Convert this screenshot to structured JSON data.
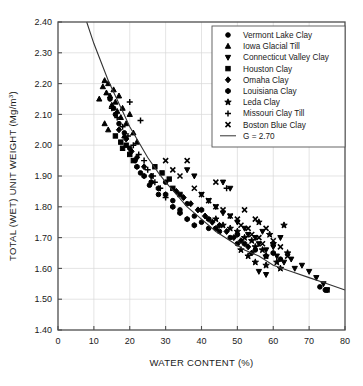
{
  "chart_data": {
    "type": "scatter",
    "title": "",
    "xlabel": "WATER CONTENT (%)",
    "ylabel": "TOTAL (WET) UNIT WEIGHT (Mg/m³)",
    "ylabel_main": "TOTAL (WET) UNIT WEIGHT (Mg/m",
    "ylabel_sup": "3",
    "ylabel_tail": ")",
    "xlim": [
      0,
      80
    ],
    "ylim": [
      1.4,
      2.4
    ],
    "xticks": [
      0,
      10,
      20,
      30,
      40,
      50,
      60,
      70,
      80
    ],
    "yticks": [
      "1.40",
      "1.50",
      "1.60",
      "1.70",
      "1.80",
      "1.90",
      "2.00",
      "2.10",
      "2.20",
      "2.30",
      "2.40"
    ],
    "xtick_labels": [
      "0",
      "10",
      "20",
      "30",
      "40",
      "50",
      "60",
      "70",
      "80"
    ],
    "grid": true,
    "grid_color": "#d9d9d9",
    "axis_color": "#4d4d4d",
    "marker_color": "#000000",
    "legend_position": "top-right",
    "legend": [
      {
        "label": "Vermont Lake Clay",
        "marker": "circle"
      },
      {
        "label": "Iowa Glacial Till",
        "marker": "triangle-up"
      },
      {
        "label": "Connecticut Valley Clay",
        "marker": "triangle-down"
      },
      {
        "label": "Houston Clay",
        "marker": "square"
      },
      {
        "label": "Omaha Clay",
        "marker": "diamond"
      },
      {
        "label": "Louisiana Clay",
        "marker": "hexagon"
      },
      {
        "label": "Leda Clay",
        "marker": "star"
      },
      {
        "label": "Missouri Clay Till",
        "marker": "plus"
      },
      {
        "label": "Boston Blue Clay",
        "marker": "x"
      },
      {
        "label": "G = 2.70",
        "marker": "line"
      }
    ],
    "curve": {
      "name": "G = 2.70",
      "label": "G = 2.70",
      "specific_gravity": 2.7,
      "description": "Zero air voids (100% saturation) line for specific gravity 2.70",
      "points": [
        {
          "x": 8.0,
          "y": 2.4
        },
        {
          "x": 10.0,
          "y": 2.33
        },
        {
          "x": 12.0,
          "y": 2.27
        },
        {
          "x": 14.0,
          "y": 2.21
        },
        {
          "x": 16.0,
          "y": 2.16
        },
        {
          "x": 18.0,
          "y": 2.11
        },
        {
          "x": 20.0,
          "y": 2.06
        },
        {
          "x": 22.0,
          "y": 2.02
        },
        {
          "x": 25.0,
          "y": 1.96
        },
        {
          "x": 28.0,
          "y": 1.91
        },
        {
          "x": 30.0,
          "y": 1.88
        },
        {
          "x": 33.0,
          "y": 1.84
        },
        {
          "x": 36.0,
          "y": 1.8
        },
        {
          "x": 40.0,
          "y": 1.76
        },
        {
          "x": 44.0,
          "y": 1.72
        },
        {
          "x": 48.0,
          "y": 1.69
        },
        {
          "x": 52.0,
          "y": 1.66
        },
        {
          "x": 56.0,
          "y": 1.64
        },
        {
          "x": 60.0,
          "y": 1.61
        },
        {
          "x": 65.0,
          "y": 1.59
        },
        {
          "x": 70.0,
          "y": 1.57
        },
        {
          "x": 75.0,
          "y": 1.55
        },
        {
          "x": 80.0,
          "y": 1.53
        }
      ]
    },
    "series": [
      {
        "name": "Vermont Lake Clay",
        "marker": "circle",
        "points": [
          {
            "x": 14.5,
            "y": 2.15
          },
          {
            "x": 15.5,
            "y": 2.12
          },
          {
            "x": 16.0,
            "y": 2.1
          },
          {
            "x": 17.0,
            "y": 2.07
          },
          {
            "x": 18.5,
            "y": 2.04
          },
          {
            "x": 20.0,
            "y": 1.99
          },
          {
            "x": 21.5,
            "y": 1.95
          },
          {
            "x": 23.0,
            "y": 1.91
          },
          {
            "x": 25.5,
            "y": 1.87
          },
          {
            "x": 28.0,
            "y": 1.84
          },
          {
            "x": 30.0,
            "y": 1.88
          },
          {
            "x": 32.0,
            "y": 1.82
          },
          {
            "x": 34.0,
            "y": 1.79
          },
          {
            "x": 36.0,
            "y": 1.81
          },
          {
            "x": 38.0,
            "y": 1.77
          },
          {
            "x": 40.0,
            "y": 1.75
          },
          {
            "x": 42.0,
            "y": 1.73
          },
          {
            "x": 45.0,
            "y": 1.72
          },
          {
            "x": 48.0,
            "y": 1.7
          },
          {
            "x": 50.0,
            "y": 1.68
          },
          {
            "x": 55.0,
            "y": 1.66
          },
          {
            "x": 58.0,
            "y": 1.64
          },
          {
            "x": 62.0,
            "y": 1.63
          },
          {
            "x": 73.0,
            "y": 1.54
          },
          {
            "x": 74.5,
            "y": 1.53
          }
        ]
      },
      {
        "name": "Iowa Glacial Till",
        "marker": "triangle-up",
        "points": [
          {
            "x": 11.5,
            "y": 2.15
          },
          {
            "x": 12.5,
            "y": 2.19
          },
          {
            "x": 13.0,
            "y": 2.21
          },
          {
            "x": 13.5,
            "y": 2.17
          },
          {
            "x": 14.0,
            "y": 2.2
          },
          {
            "x": 14.5,
            "y": 2.16
          },
          {
            "x": 15.0,
            "y": 2.13
          },
          {
            "x": 15.5,
            "y": 2.18
          },
          {
            "x": 16.0,
            "y": 2.14
          },
          {
            "x": 16.5,
            "y": 2.11
          },
          {
            "x": 17.0,
            "y": 2.16
          },
          {
            "x": 17.5,
            "y": 2.09
          },
          {
            "x": 18.0,
            "y": 2.12
          },
          {
            "x": 19.0,
            "y": 2.07
          },
          {
            "x": 20.0,
            "y": 2.1
          },
          {
            "x": 13.0,
            "y": 2.07
          },
          {
            "x": 14.0,
            "y": 2.05
          },
          {
            "x": 18.5,
            "y": 2.03
          },
          {
            "x": 21.0,
            "y": 2.04
          },
          {
            "x": 22.0,
            "y": 2.01
          }
        ]
      },
      {
        "name": "Connecticut Valley Clay",
        "marker": "triangle-down",
        "points": [
          {
            "x": 36.0,
            "y": 1.92
          },
          {
            "x": 38.0,
            "y": 1.9
          },
          {
            "x": 40.0,
            "y": 1.84
          },
          {
            "x": 42.0,
            "y": 1.82
          },
          {
            "x": 44.0,
            "y": 1.8
          },
          {
            "x": 46.0,
            "y": 1.78
          },
          {
            "x": 48.0,
            "y": 1.77
          },
          {
            "x": 50.0,
            "y": 1.75
          },
          {
            "x": 52.0,
            "y": 1.73
          },
          {
            "x": 53.0,
            "y": 1.71
          },
          {
            "x": 55.0,
            "y": 1.7
          },
          {
            "x": 56.0,
            "y": 1.68
          },
          {
            "x": 57.0,
            "y": 1.72
          },
          {
            "x": 58.0,
            "y": 1.66
          },
          {
            "x": 60.0,
            "y": 1.67
          },
          {
            "x": 61.0,
            "y": 1.64
          },
          {
            "x": 62.0,
            "y": 1.7
          },
          {
            "x": 63.0,
            "y": 1.62
          },
          {
            "x": 65.0,
            "y": 1.63
          },
          {
            "x": 66.0,
            "y": 1.6
          },
          {
            "x": 68.0,
            "y": 1.61
          },
          {
            "x": 70.0,
            "y": 1.59
          },
          {
            "x": 72.0,
            "y": 1.57
          },
          {
            "x": 74.0,
            "y": 1.55
          },
          {
            "x": 75.0,
            "y": 1.53
          },
          {
            "x": 56.0,
            "y": 1.59
          },
          {
            "x": 58.0,
            "y": 1.58
          },
          {
            "x": 46.0,
            "y": 1.88
          },
          {
            "x": 48.0,
            "y": 1.86
          }
        ]
      },
      {
        "name": "Houston Clay",
        "marker": "square",
        "points": [
          {
            "x": 16.0,
            "y": 2.03
          },
          {
            "x": 17.5,
            "y": 2.01
          },
          {
            "x": 18.0,
            "y": 1.99
          },
          {
            "x": 19.0,
            "y": 2.0
          },
          {
            "x": 20.0,
            "y": 1.97
          },
          {
            "x": 21.0,
            "y": 1.95
          },
          {
            "x": 27.0,
            "y": 1.93
          },
          {
            "x": 29.0,
            "y": 1.91
          },
          {
            "x": 31.0,
            "y": 1.89
          },
          {
            "x": 32.0,
            "y": 1.86
          },
          {
            "x": 34.0,
            "y": 1.84
          },
          {
            "x": 75.0,
            "y": 1.53
          }
        ]
      },
      {
        "name": "Omaha Clay",
        "marker": "diamond",
        "points": [
          {
            "x": 17.0,
            "y": 2.05
          },
          {
            "x": 19.0,
            "y": 2.02
          },
          {
            "x": 20.5,
            "y": 1.98
          },
          {
            "x": 22.0,
            "y": 1.96
          },
          {
            "x": 24.0,
            "y": 1.93
          },
          {
            "x": 26.0,
            "y": 1.9
          },
          {
            "x": 33.0,
            "y": 1.85
          },
          {
            "x": 35.0,
            "y": 1.83
          },
          {
            "x": 37.0,
            "y": 1.81
          },
          {
            "x": 39.0,
            "y": 1.79
          },
          {
            "x": 41.0,
            "y": 1.77
          },
          {
            "x": 43.0,
            "y": 1.75
          },
          {
            "x": 45.0,
            "y": 1.74
          },
          {
            "x": 47.0,
            "y": 1.72
          },
          {
            "x": 49.0,
            "y": 1.7
          },
          {
            "x": 51.0,
            "y": 1.69
          },
          {
            "x": 53.0,
            "y": 1.67
          },
          {
            "x": 54.0,
            "y": 1.65
          }
        ]
      },
      {
        "name": "Louisiana Clay",
        "marker": "hexagon",
        "points": [
          {
            "x": 22.0,
            "y": 1.93
          },
          {
            "x": 24.0,
            "y": 1.9
          },
          {
            "x": 26.0,
            "y": 1.88
          },
          {
            "x": 28.0,
            "y": 1.86
          },
          {
            "x": 30.0,
            "y": 1.84
          },
          {
            "x": 32.0,
            "y": 1.8
          },
          {
            "x": 34.0,
            "y": 1.78
          },
          {
            "x": 36.0,
            "y": 1.76
          },
          {
            "x": 38.0,
            "y": 1.74
          },
          {
            "x": 40.0,
            "y": 1.79
          },
          {
            "x": 42.0,
            "y": 1.76
          },
          {
            "x": 44.0,
            "y": 1.73
          },
          {
            "x": 50.0,
            "y": 1.71
          },
          {
            "x": 52.0,
            "y": 1.68
          },
          {
            "x": 60.0,
            "y": 1.65
          }
        ]
      },
      {
        "name": "Leda Clay",
        "marker": "star",
        "points": [
          {
            "x": 44.0,
            "y": 1.76
          },
          {
            "x": 46.0,
            "y": 1.74
          },
          {
            "x": 48.0,
            "y": 1.73
          },
          {
            "x": 50.0,
            "y": 1.72
          },
          {
            "x": 52.0,
            "y": 1.7
          },
          {
            "x": 54.0,
            "y": 1.69
          },
          {
            "x": 55.0,
            "y": 1.67
          },
          {
            "x": 56.0,
            "y": 1.75
          },
          {
            "x": 57.0,
            "y": 1.66
          },
          {
            "x": 58.0,
            "y": 1.64
          },
          {
            "x": 59.0,
            "y": 1.71
          },
          {
            "x": 60.0,
            "y": 1.68
          },
          {
            "x": 61.0,
            "y": 1.62
          },
          {
            "x": 62.0,
            "y": 1.6
          },
          {
            "x": 63.0,
            "y": 1.74
          },
          {
            "x": 64.0,
            "y": 1.65
          },
          {
            "x": 55.0,
            "y": 1.62
          },
          {
            "x": 53.0,
            "y": 1.64
          },
          {
            "x": 58.0,
            "y": 1.61
          },
          {
            "x": 51.0,
            "y": 1.66
          }
        ]
      },
      {
        "name": "Missouri Clay Till",
        "marker": "plus",
        "points": [
          {
            "x": 15.0,
            "y": 2.12
          },
          {
            "x": 16.5,
            "y": 2.09
          },
          {
            "x": 18.0,
            "y": 2.06
          },
          {
            "x": 19.5,
            "y": 2.03
          },
          {
            "x": 21.0,
            "y": 2.0
          },
          {
            "x": 22.5,
            "y": 1.97
          },
          {
            "x": 24.0,
            "y": 1.95
          },
          {
            "x": 25.0,
            "y": 1.92
          },
          {
            "x": 26.5,
            "y": 1.9
          },
          {
            "x": 23.0,
            "y": 2.08
          },
          {
            "x": 20.0,
            "y": 2.14
          },
          {
            "x": 27.0,
            "y": 1.88
          },
          {
            "x": 28.5,
            "y": 1.86
          },
          {
            "x": 30.0,
            "y": 1.83
          },
          {
            "x": 47.0,
            "y": 1.86
          }
        ]
      },
      {
        "name": "Boston Blue Clay",
        "marker": "x",
        "points": [
          {
            "x": 30.0,
            "y": 1.95
          },
          {
            "x": 32.0,
            "y": 1.92
          },
          {
            "x": 34.0,
            "y": 1.9
          },
          {
            "x": 36.0,
            "y": 1.95
          },
          {
            "x": 38.0,
            "y": 1.86
          },
          {
            "x": 40.0,
            "y": 1.84
          },
          {
            "x": 42.0,
            "y": 1.82
          },
          {
            "x": 44.0,
            "y": 1.8
          },
          {
            "x": 46.0,
            "y": 1.79
          },
          {
            "x": 48.0,
            "y": 1.77
          },
          {
            "x": 50.0,
            "y": 1.76
          },
          {
            "x": 51.0,
            "y": 1.74
          },
          {
            "x": 52.0,
            "y": 1.79
          },
          {
            "x": 53.0,
            "y": 1.73
          },
          {
            "x": 54.0,
            "y": 1.71
          },
          {
            "x": 55.0,
            "y": 1.76
          },
          {
            "x": 56.0,
            "y": 1.7
          },
          {
            "x": 57.0,
            "y": 1.68
          },
          {
            "x": 58.0,
            "y": 1.73
          },
          {
            "x": 60.0,
            "y": 1.69
          },
          {
            "x": 62.0,
            "y": 1.67
          },
          {
            "x": 44.0,
            "y": 1.88
          },
          {
            "x": 64.0,
            "y": 1.64
          }
        ]
      }
    ]
  }
}
